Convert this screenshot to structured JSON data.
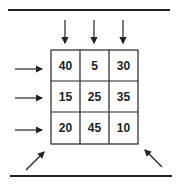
{
  "diagram": {
    "grid": [
      [
        "40",
        "5",
        "30"
      ],
      [
        "15",
        "25",
        "35"
      ],
      [
        "20",
        "45",
        "10"
      ]
    ],
    "arrows": {
      "top": 3,
      "left": 3,
      "diagonal": [
        "bottom-left",
        "bottom-right"
      ]
    },
    "colors": {
      "ink": "#222222",
      "background": "#ffffff"
    }
  }
}
